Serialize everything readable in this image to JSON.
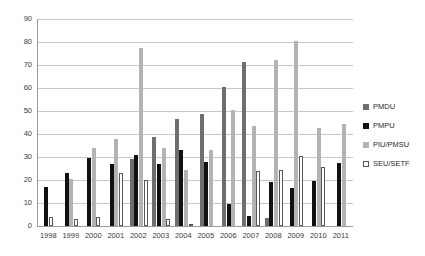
{
  "chart_data": {
    "type": "bar",
    "title": "",
    "subtitle": "",
    "xlabel": "",
    "ylabel": "",
    "ylim": [
      0,
      90
    ],
    "ytick_step": 10,
    "yticks": [
      "90",
      "80",
      "70",
      "60",
      "50",
      "40",
      "30",
      "20",
      "10",
      "0"
    ],
    "grid": true,
    "legend_position": "right",
    "categories": [
      "1998",
      "1999",
      "2000",
      "2001",
      "2002",
      "2003",
      "2004",
      "2005",
      "2006",
      "2007",
      "2008",
      "2009",
      "2010",
      "2011"
    ],
    "series": [
      {
        "name": "PMDU",
        "color": "#6e6e6e",
        "values": [
          null,
          null,
          null,
          null,
          29,
          38.5,
          46.5,
          48.5,
          60.5,
          71.5,
          3.5,
          null,
          null,
          null
        ]
      },
      {
        "name": "PMPU",
        "color": "#111111",
        "values": [
          17,
          23,
          29.5,
          27,
          31,
          27,
          33,
          28,
          9.5,
          4.5,
          19,
          16.5,
          19.5,
          27.5
        ]
      },
      {
        "name": "PIU/PMSU",
        "color": "#b3b3b3",
        "values": [
          null,
          20.5,
          34,
          38,
          77.5,
          34,
          24.5,
          33,
          50.5,
          43.5,
          72,
          80.5,
          42.5,
          44.5
        ]
      },
      {
        "name": "SEU/SETF",
        "color": "#ffffff",
        "values": [
          4,
          3,
          4,
          23,
          20,
          3,
          1,
          null,
          null,
          24,
          24.5,
          30.5,
          25.5,
          null
        ]
      }
    ]
  },
  "legend": {
    "items": [
      {
        "label": "PMDU"
      },
      {
        "label": "PMPU"
      },
      {
        "label": "PIU/PMSU"
      },
      {
        "label": "SEU/SETF"
      }
    ]
  }
}
